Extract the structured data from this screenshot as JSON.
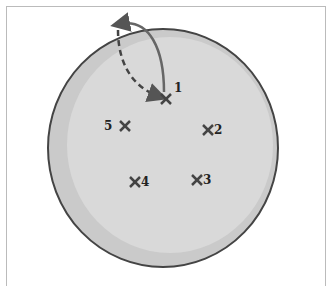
{
  "diagram": {
    "dish": {
      "fill": "#d6d6d6",
      "rim": "#4a4a4a",
      "shadow": "#c4c4c4"
    },
    "markers": [
      {
        "id": "1",
        "label": "1",
        "x": 166,
        "y": 99,
        "lx": 174,
        "ly": 92
      },
      {
        "id": "2",
        "label": "2",
        "x": 208,
        "y": 130,
        "lx": 214,
        "ly": 134
      },
      {
        "id": "3",
        "label": "3",
        "x": 197,
        "y": 180,
        "lx": 203,
        "ly": 184
      },
      {
        "id": "4",
        "label": "4",
        "x": 135,
        "y": 182,
        "lx": 141,
        "ly": 186
      },
      {
        "id": "5",
        "label": "5",
        "x": 125,
        "y": 126,
        "lx": 104,
        "ly": 130
      }
    ],
    "arrows": {
      "solid": "lift from position 1",
      "dashed": "return to position 1"
    }
  }
}
